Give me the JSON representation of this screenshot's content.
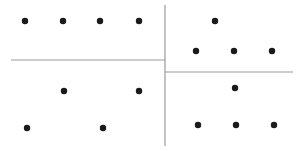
{
  "diagram": {
    "colors": {
      "dot": "#1a1a1a",
      "line": "#9a9a9a",
      "background": "#ffffff"
    },
    "lines": [
      {
        "id": "vertical-divider",
        "x1": 165,
        "y1": 5,
        "x2": 165,
        "y2": 146
      },
      {
        "id": "left-horizontal-divider",
        "x1": 11,
        "y1": 60,
        "x2": 165,
        "y2": 60
      },
      {
        "id": "right-horizontal-divider",
        "x1": 165,
        "y1": 72,
        "x2": 293,
        "y2": 72
      }
    ],
    "quadrants": [
      {
        "name": "top-left",
        "dots": [
          [
            25,
            21
          ],
          [
            63,
            21
          ],
          [
            100,
            21
          ],
          [
            139,
            21
          ]
        ]
      },
      {
        "name": "top-right",
        "dots": [
          [
            215,
            21
          ],
          [
            196,
            51
          ],
          [
            234,
            51
          ],
          [
            272,
            51
          ]
        ]
      },
      {
        "name": "bottom-left",
        "dots": [
          [
            64,
            91
          ],
          [
            139,
            91
          ],
          [
            27,
            128
          ],
          [
            103,
            128
          ]
        ]
      },
      {
        "name": "bottom-right",
        "dots": [
          [
            235,
            88
          ],
          [
            198,
            125
          ],
          [
            236,
            125
          ],
          [
            274,
            125
          ]
        ]
      }
    ],
    "dot_radius": 3.2
  }
}
